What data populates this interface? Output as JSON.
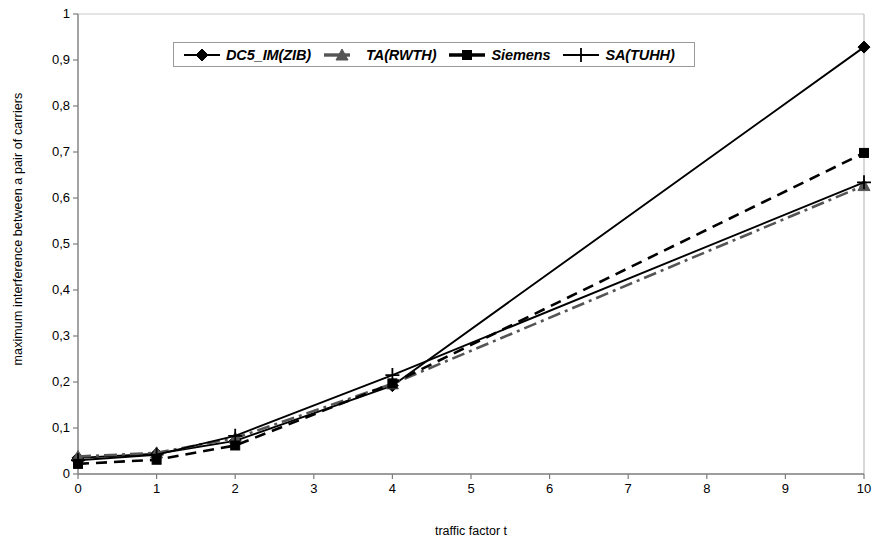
{
  "chart_data": {
    "type": "line",
    "title": "",
    "xlabel": "traffic factor t",
    "ylabel": "maximum interference between a pair of carriers",
    "x": [
      0,
      1,
      2,
      4,
      10
    ],
    "xlim": [
      0,
      10
    ],
    "ylim": [
      0,
      1
    ],
    "grid": false,
    "legend_position": "top-center",
    "xtick_labels": [
      "0",
      "1",
      "2",
      "3",
      "4",
      "5",
      "6",
      "7",
      "8",
      "9",
      "10"
    ],
    "xtick_values": [
      0,
      1,
      2,
      3,
      4,
      5,
      6,
      7,
      8,
      9,
      10
    ],
    "ytick_labels": [
      "0",
      "0,1",
      "0,2",
      "0,3",
      "0,4",
      "0,5",
      "0,6",
      "0,7",
      "0,8",
      "0,9",
      "1"
    ],
    "ytick_values": [
      0,
      0.1,
      0.2,
      0.3,
      0.4,
      0.5,
      0.6,
      0.7,
      0.8,
      0.9,
      1
    ],
    "series": [
      {
        "name": "DC5_IM(ZIB)",
        "marker": "diamond",
        "line_style": "solid",
        "color": "#000000",
        "values": [
          0.035,
          0.044,
          0.072,
          0.192,
          0.928
        ]
      },
      {
        "name": "TA(RWTH)",
        "marker": "triangle",
        "line_style": "dash-dot",
        "color": "#555555",
        "values": [
          0.038,
          0.046,
          0.078,
          0.196,
          0.627
        ]
      },
      {
        "name": "Siemens",
        "marker": "square",
        "line_style": "dashed",
        "color": "#000000",
        "values": [
          0.022,
          0.031,
          0.062,
          0.197,
          0.698
        ]
      },
      {
        "name": "SA(TUHH)",
        "marker": "plus",
        "line_style": "solid",
        "color": "#000000",
        "values": [
          0.03,
          0.042,
          0.083,
          0.215,
          0.634
        ]
      }
    ]
  },
  "legend": {
    "items": [
      {
        "label": "DC5_IM(ZIB)",
        "marker": "diamond-marker"
      },
      {
        "label": "TA(RWTH)",
        "marker": "triangle-marker"
      },
      {
        "label": "Siemens",
        "marker": "square-marker"
      },
      {
        "label": "SA(TUHH)",
        "marker": "plus-marker"
      }
    ]
  }
}
